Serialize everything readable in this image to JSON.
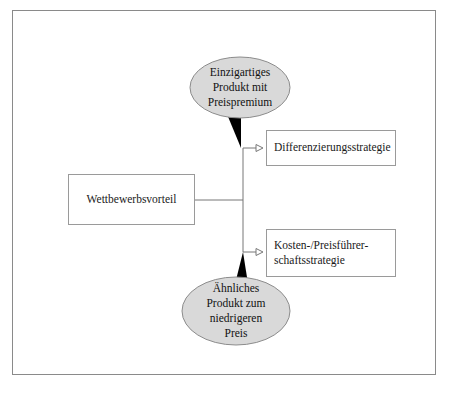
{
  "diagram": {
    "type": "tree-with-callouts",
    "colors": {
      "frame_border": "#8a8a8a",
      "box_border": "#9a9a9a",
      "box_fill": "#ffffff",
      "bubble_fill": "#d9d9d9",
      "bubble_border": "#8c8c8c",
      "tail_fill": "#000000",
      "connector": "#777777",
      "text": "#1a1a1a",
      "page_background": "#ffffff"
    },
    "root_node": {
      "label": "Wettbewerbsvorteil"
    },
    "branches": [
      {
        "id": "differenzierung",
        "label_lines": [
          "Differenzierungsstrategie"
        ],
        "callout_lines": [
          "Einzigartiges",
          "Produkt mit",
          "Preispremium"
        ]
      },
      {
        "id": "kosten",
        "label_lines": [
          "Kosten-/Preisführer-",
          "schaftsstrategie"
        ],
        "callout_lines": [
          "Ähnliches",
          "Produkt zum",
          "niedrigeren",
          "Preis"
        ]
      }
    ]
  }
}
